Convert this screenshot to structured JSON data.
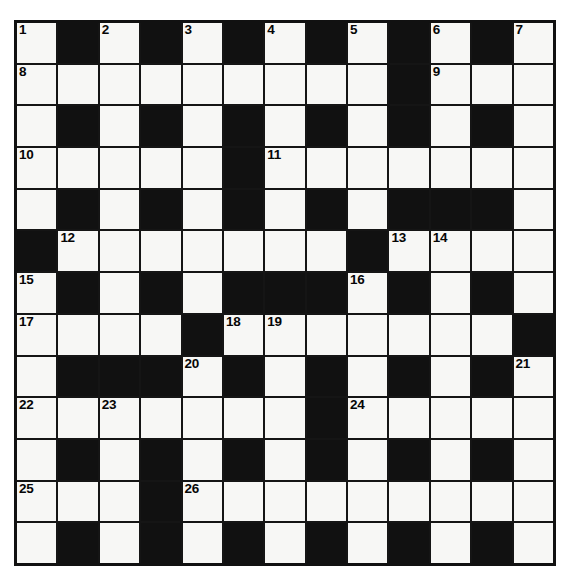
{
  "puzzle": {
    "kind": "crossword-grid",
    "rows": 13,
    "cols": 13,
    "colors": {
      "block": "#111111",
      "open_cell": "#f7f7f5",
      "border": "#111111",
      "number_text": "#060606",
      "page_background": "#ffffff"
    },
    "grid": [
      [
        "open",
        "block",
        "open",
        "block",
        "open",
        "block",
        "open",
        "block",
        "open",
        "block",
        "open",
        "block",
        "open"
      ],
      [
        "open",
        "open",
        "open",
        "open",
        "open",
        "open",
        "open",
        "open",
        "open",
        "block",
        "open",
        "open",
        "open"
      ],
      [
        "open",
        "block",
        "open",
        "block",
        "open",
        "block",
        "open",
        "block",
        "open",
        "block",
        "open",
        "block",
        "open"
      ],
      [
        "open",
        "open",
        "open",
        "open",
        "open",
        "block",
        "open",
        "open",
        "open",
        "open",
        "open",
        "open",
        "open"
      ],
      [
        "open",
        "block",
        "open",
        "block",
        "open",
        "block",
        "open",
        "block",
        "open",
        "block",
        "block",
        "block",
        "open"
      ],
      [
        "block",
        "open",
        "open",
        "open",
        "open",
        "open",
        "open",
        "open",
        "block",
        "open",
        "open",
        "open",
        "open"
      ],
      [
        "open",
        "block",
        "open",
        "block",
        "open",
        "block",
        "block",
        "block",
        "open",
        "block",
        "open",
        "block",
        "open"
      ],
      [
        "open",
        "open",
        "open",
        "open",
        "block",
        "open",
        "open",
        "open",
        "open",
        "open",
        "open",
        "open",
        "block"
      ],
      [
        "open",
        "block",
        "block",
        "block",
        "open",
        "block",
        "open",
        "block",
        "open",
        "block",
        "open",
        "block",
        "open"
      ],
      [
        "open",
        "open",
        "open",
        "open",
        "open",
        "open",
        "open",
        "block",
        "open",
        "open",
        "open",
        "open",
        "open"
      ],
      [
        "open",
        "block",
        "open",
        "block",
        "open",
        "block",
        "open",
        "block",
        "open",
        "block",
        "open",
        "block",
        "open"
      ],
      [
        "open",
        "open",
        "open",
        "block",
        "open",
        "open",
        "open",
        "open",
        "open",
        "open",
        "open",
        "open",
        "open"
      ],
      [
        "open",
        "block",
        "open",
        "block",
        "open",
        "block",
        "open",
        "block",
        "open",
        "block",
        "open",
        "block",
        "open"
      ]
    ],
    "numbers": [
      {
        "row": 1,
        "col": 1,
        "label": "1"
      },
      {
        "row": 1,
        "col": 3,
        "label": "2"
      },
      {
        "row": 1,
        "col": 5,
        "label": "3"
      },
      {
        "row": 1,
        "col": 7,
        "label": "4"
      },
      {
        "row": 1,
        "col": 9,
        "label": "5"
      },
      {
        "row": 1,
        "col": 11,
        "label": "6"
      },
      {
        "row": 1,
        "col": 13,
        "label": "7"
      },
      {
        "row": 2,
        "col": 1,
        "label": "8"
      },
      {
        "row": 2,
        "col": 11,
        "label": "9"
      },
      {
        "row": 4,
        "col": 1,
        "label": "10"
      },
      {
        "row": 4,
        "col": 7,
        "label": "11"
      },
      {
        "row": 6,
        "col": 2,
        "label": "12"
      },
      {
        "row": 6,
        "col": 10,
        "label": "13"
      },
      {
        "row": 6,
        "col": 11,
        "label": "14"
      },
      {
        "row": 7,
        "col": 1,
        "label": "15"
      },
      {
        "row": 7,
        "col": 9,
        "label": "16"
      },
      {
        "row": 8,
        "col": 1,
        "label": "17"
      },
      {
        "row": 8,
        "col": 6,
        "label": "18"
      },
      {
        "row": 8,
        "col": 7,
        "label": "19"
      },
      {
        "row": 9,
        "col": 5,
        "label": "20"
      },
      {
        "row": 9,
        "col": 13,
        "label": "21"
      },
      {
        "row": 10,
        "col": 1,
        "label": "22"
      },
      {
        "row": 10,
        "col": 3,
        "label": "23"
      },
      {
        "row": 10,
        "col": 9,
        "label": "24"
      },
      {
        "row": 12,
        "col": 1,
        "label": "25"
      },
      {
        "row": 12,
        "col": 5,
        "label": "26"
      }
    ],
    "letters": []
  }
}
